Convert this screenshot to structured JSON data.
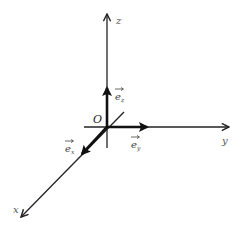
{
  "diagram": {
    "origin": {
      "label": "O",
      "x": 107,
      "y": 127
    },
    "colors": {
      "axis": "#222222",
      "vector": "#111111",
      "label": "#444444"
    },
    "axes": [
      {
        "id": "z",
        "label": "z",
        "from": [
          107,
          127
        ],
        "to": [
          107,
          14
        ],
        "label_pos": [
          116,
          22
        ]
      },
      {
        "id": "y",
        "label": "y",
        "from": [
          107,
          127
        ],
        "to": [
          228,
          127
        ],
        "label_pos": [
          224,
          143
        ]
      },
      {
        "id": "x",
        "label": "x",
        "from": [
          107,
          127
        ],
        "to": [
          22,
          216
        ],
        "label_pos": [
          14,
          211
        ]
      },
      {
        "id": "z-neg",
        "label": "",
        "from": [
          107,
          127
        ],
        "to": [
          107,
          148
        ]
      },
      {
        "id": "x-neg",
        "label": "",
        "from": [
          107,
          127
        ],
        "to": [
          124,
          112
        ]
      }
    ],
    "unit_vectors": [
      {
        "id": "e_z",
        "symbol": "e",
        "subscript": "z",
        "from": [
          107,
          127
        ],
        "to": [
          107,
          90
        ],
        "label_pos": [
          118,
          96
        ]
      },
      {
        "id": "e_y",
        "symbol": "e",
        "subscript": "y",
        "from": [
          107,
          127
        ],
        "to": [
          146,
          127
        ],
        "label_pos": [
          135,
          147
        ]
      },
      {
        "id": "e_x",
        "symbol": "e",
        "subscript": "x",
        "from": [
          107,
          127
        ],
        "to": [
          83,
          153
        ],
        "label_pos": [
          64,
          150
        ]
      }
    ]
  }
}
